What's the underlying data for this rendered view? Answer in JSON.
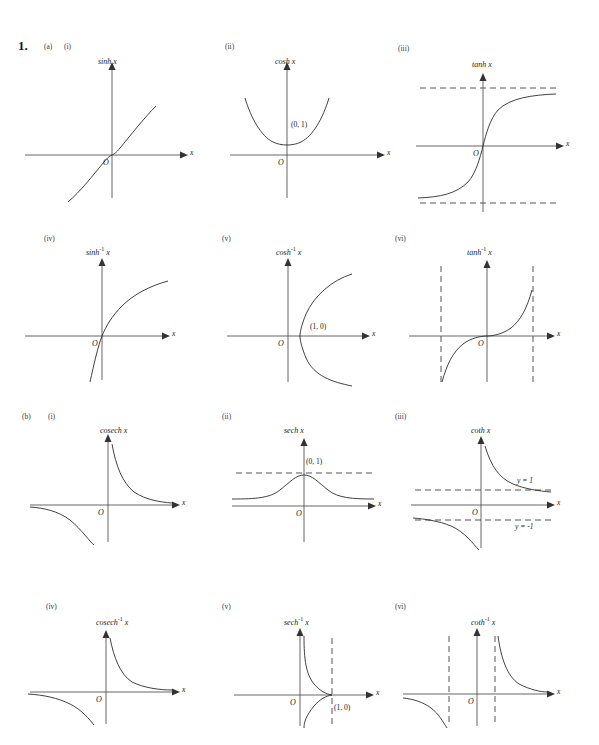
{
  "page": {
    "question_number": "1.",
    "background": "#ffffff",
    "ink_color": "#2b2b2b"
  },
  "sections": [
    {
      "id": "a",
      "label": "(a)"
    },
    {
      "id": "b",
      "label": "(b)"
    }
  ],
  "graphs": [
    {
      "roman": "(i)",
      "title": "sinh",
      "title_sup": "",
      "title_var": "x",
      "origin_label": "O",
      "x_axis_label": "x",
      "point_labels": [],
      "asymptote_labels": [],
      "curve_type": "sinh"
    },
    {
      "roman": "(ii)",
      "title": "cosh",
      "title_sup": "",
      "title_var": "x",
      "origin_label": "O",
      "x_axis_label": "x",
      "point_labels": [
        "(0, 1)"
      ],
      "asymptote_labels": [],
      "curve_type": "cosh"
    },
    {
      "roman": "(iii)",
      "title": "tanh",
      "title_sup": "",
      "title_var": "x",
      "origin_label": "O",
      "x_axis_label": "x",
      "point_labels": [],
      "asymptote_labels": [],
      "curve_type": "tanh"
    },
    {
      "roman": "(iv)",
      "title": "sinh",
      "title_sup": "-1",
      "title_var": "x",
      "origin_label": "O",
      "x_axis_label": "x",
      "point_labels": [],
      "asymptote_labels": [],
      "curve_type": "arcsinh"
    },
    {
      "roman": "(v)",
      "title": "cosh",
      "title_sup": "-1",
      "title_var": "x",
      "origin_label": "O",
      "x_axis_label": "x",
      "point_labels": [
        "(1, 0)"
      ],
      "asymptote_labels": [],
      "curve_type": "arccosh"
    },
    {
      "roman": "(vi)",
      "title": "tanh",
      "title_sup": "-1",
      "title_var": "x",
      "origin_label": "O",
      "x_axis_label": "x",
      "point_labels": [],
      "asymptote_labels": [],
      "curve_type": "arctanh"
    },
    {
      "roman": "(i)",
      "title": "cosech",
      "title_sup": "",
      "title_var": "x",
      "origin_label": "O",
      "x_axis_label": "x",
      "point_labels": [],
      "asymptote_labels": [],
      "curve_type": "cosech"
    },
    {
      "roman": "(ii)",
      "title": "sech",
      "title_sup": "",
      "title_var": "x",
      "origin_label": "O",
      "x_axis_label": "x",
      "point_labels": [
        "(0, 1)"
      ],
      "asymptote_labels": [],
      "curve_type": "sech"
    },
    {
      "roman": "(iii)",
      "title": "coth",
      "title_sup": "",
      "title_var": "x",
      "origin_label": "O",
      "x_axis_label": "x",
      "point_labels": [],
      "asymptote_labels": [
        "y = 1",
        "y = -1"
      ],
      "curve_type": "coth"
    },
    {
      "roman": "(iv)",
      "title": "cosech",
      "title_sup": "-1",
      "title_var": "x",
      "origin_label": "O",
      "x_axis_label": "x",
      "point_labels": [],
      "asymptote_labels": [],
      "curve_type": "arccosech"
    },
    {
      "roman": "(v)",
      "title": "sech",
      "title_sup": "-1",
      "title_var": "x",
      "origin_label": "O",
      "x_axis_label": "x",
      "point_labels": [
        "(1, 0)"
      ],
      "asymptote_labels": [],
      "curve_type": "arcsech"
    },
    {
      "roman": "(vi)",
      "title": "coth",
      "title_sup": "-1",
      "title_var": "x",
      "origin_label": "O",
      "x_axis_label": "x",
      "point_labels": [],
      "asymptote_labels": [],
      "curve_type": "arccoth"
    }
  ]
}
